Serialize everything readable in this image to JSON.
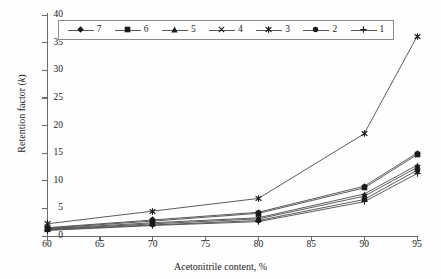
{
  "axes": {
    "y_title_pre": "Retention factor (",
    "y_title_italic": "k",
    "y_title_post": ")",
    "x_title": "Acetonitrile content, %",
    "y_ticks": [
      "0",
      "5",
      "10",
      "15",
      "20",
      "25",
      "30",
      "35",
      "40"
    ],
    "x_ticks": [
      "60",
      "65",
      "70",
      "75",
      "80",
      "85",
      "90",
      "95"
    ],
    "ylim": [
      0,
      40
    ],
    "xlim": [
      60,
      95
    ]
  },
  "legend": {
    "position": "top-left-inside",
    "items": [
      {
        "label": "7",
        "marker": "diamond"
      },
      {
        "label": "6",
        "marker": "square"
      },
      {
        "label": "5",
        "marker": "triangle"
      },
      {
        "label": "4",
        "marker": "x"
      },
      {
        "label": "3",
        "marker": "asterisk"
      },
      {
        "label": "2",
        "marker": "circle"
      },
      {
        "label": "1",
        "marker": "plus"
      }
    ]
  },
  "chart_data": {
    "type": "line",
    "title": "",
    "xlabel": "Acetonitrile content, %",
    "ylabel": "Retention factor (k)",
    "xlim": [
      60,
      95
    ],
    "ylim": [
      0,
      40
    ],
    "grid": false,
    "legend_position": "upper left",
    "x": [
      60,
      70,
      80,
      90,
      95
    ],
    "series": [
      {
        "name": "7",
        "marker": "diamond",
        "values": [
          1.5,
          2.9,
          4.3,
          9.0,
          15.0
        ]
      },
      {
        "name": "6",
        "marker": "square",
        "values": [
          1.4,
          2.7,
          4.1,
          8.7,
          14.7
        ]
      },
      {
        "name": "5",
        "marker": "triangle",
        "values": [
          1.3,
          2.4,
          3.3,
          7.6,
          12.8
        ]
      },
      {
        "name": "4",
        "marker": "x",
        "values": [
          1.2,
          2.2,
          3.1,
          7.2,
          12.4
        ]
      },
      {
        "name": "3",
        "marker": "asterisk",
        "values": [
          2.2,
          4.5,
          6.8,
          18.5,
          36.1
        ]
      },
      {
        "name": "2",
        "marker": "circle",
        "values": [
          1.1,
          2.0,
          2.8,
          6.6,
          11.9
        ]
      },
      {
        "name": "1",
        "marker": "plus",
        "values": [
          1.0,
          1.9,
          2.6,
          6.2,
          11.3
        ]
      }
    ]
  }
}
